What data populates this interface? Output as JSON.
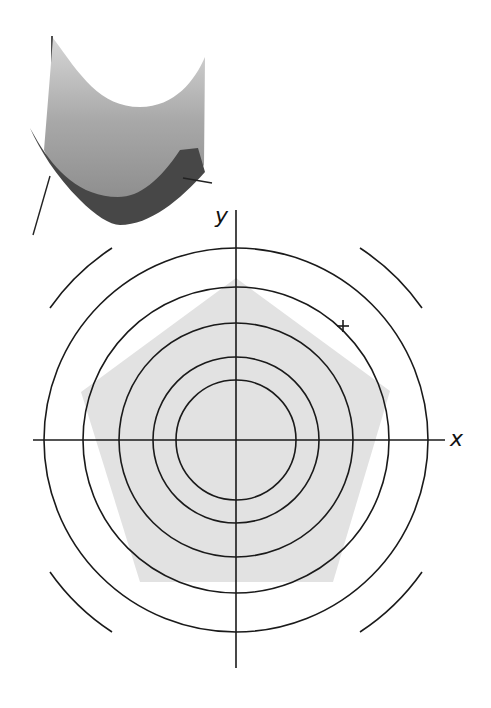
{
  "figure": {
    "surface": {
      "description": "3D paraboloid (bowl) surface with axes",
      "colors": {
        "top": "#d2d2d2",
        "mid": "#9a9a9a",
        "front_band": "#474747",
        "axis": "#222222"
      }
    },
    "contour_plot": {
      "center": [
        236,
        440
      ],
      "axis_labels": {
        "x": "x",
        "y": "y"
      },
      "circle_radii": [
        60,
        83,
        117,
        153,
        192
      ],
      "outer_arc_radius": 229,
      "outer_arcs": [
        "top-left",
        "top-right",
        "bottom-left",
        "bottom-right"
      ],
      "pentagon": {
        "fill": "#e2e2e2",
        "vertices": [
          [
            236,
            278
          ],
          [
            390,
            391
          ],
          [
            333,
            582
          ],
          [
            140,
            582
          ],
          [
            81,
            392
          ]
        ]
      },
      "marker": {
        "symbol": "+",
        "position": [
          343,
          326
        ]
      },
      "colors": {
        "line": "#1a1a1a",
        "fill": "#e2e2e2"
      }
    }
  }
}
